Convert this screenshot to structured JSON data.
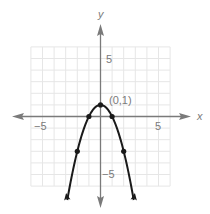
{
  "chart_data": {
    "type": "line",
    "title": "",
    "xlabel": "x",
    "ylabel": "y",
    "xlim": [
      -6,
      6
    ],
    "ylim": [
      -6,
      6
    ],
    "grid": true,
    "x_ticks_labeled": [
      -5,
      5
    ],
    "y_ticks_labeled": [
      5,
      -5
    ],
    "x_tick_labels": [
      "−5",
      "5"
    ],
    "y_tick_labels": [
      "5",
      "−5"
    ],
    "series": [
      {
        "name": "y = 1 - x^2",
        "equation": "y = -x^2 + 1",
        "x": [
          -2.5,
          -2,
          -1.5,
          -1,
          -0.5,
          0,
          0.5,
          1,
          1.5,
          2,
          2.5
        ],
        "y": [
          -5.25,
          -3,
          -1.25,
          0,
          0.75,
          1,
          0.75,
          0,
          -1.25,
          -3,
          -5.25
        ],
        "marked_points": [
          [
            -2,
            -3
          ],
          [
            -1,
            0
          ],
          [
            0,
            1
          ],
          [
            1,
            0
          ],
          [
            2,
            -3
          ]
        ],
        "arrows_at_ends": true,
        "color": "#1a1a1a"
      }
    ],
    "annotations": [
      {
        "text": "(0,1)",
        "x": 0,
        "y": 1
      }
    ]
  },
  "labels": {
    "x_axis": "x",
    "y_axis": "y",
    "x_neg5": "−5",
    "x_pos5": "5",
    "y_pos5": "5",
    "y_neg5": "−5",
    "vertex": "(0,1)"
  },
  "colors": {
    "grid": "#e6e6e6",
    "axis": "#7a7a7a",
    "curve": "#1a1a1a",
    "text": "#7a7a7a"
  }
}
